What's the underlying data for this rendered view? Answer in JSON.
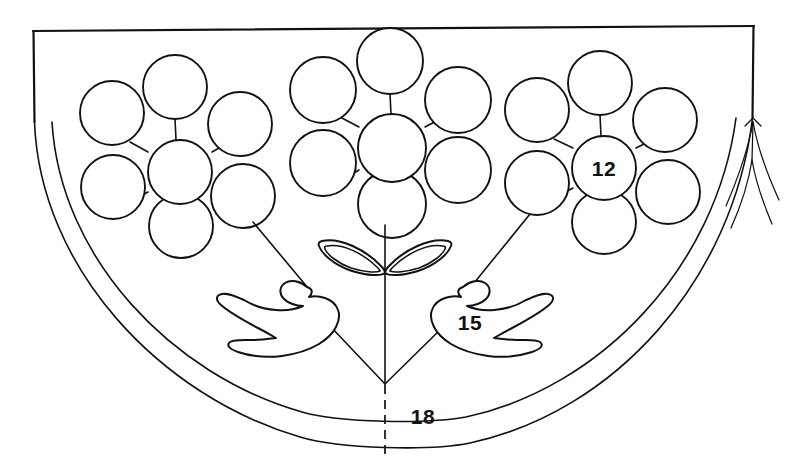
{
  "figure": {
    "background_color": "#ffffff",
    "ink_color": "#111111",
    "width": 804,
    "height": 468
  },
  "reference_labels": [
    {
      "id": "ref-12",
      "text": "12",
      "x": 604,
      "y": 176,
      "describes": "seven-circle rosette cluster"
    },
    {
      "id": "ref-15",
      "text": "15",
      "x": 470,
      "y": 330,
      "describes": "wing / leaf ornament"
    },
    {
      "id": "ref-18",
      "text": "18",
      "x": 423,
      "y": 424,
      "describes": "bowl rim band"
    }
  ],
  "outline": {
    "top_edge": {
      "x1": 33,
      "y1": 31,
      "x2": 754,
      "y2": 26
    },
    "left_edge": {
      "x1": 33,
      "y1": 31,
      "x2": 34,
      "y2": 122
    },
    "right_edge": {
      "x1": 754,
      "y1": 26,
      "x2": 753,
      "y2": 118
    },
    "outer_arc_label": "outer bowl wall",
    "inner_arc_label": "inner bowl wall"
  },
  "center_line": {
    "style": "dashed",
    "x": 385,
    "y_top": 385,
    "y_bottom": 455
  },
  "rosettes": [
    {
      "name": "left-rosette",
      "center_x": 180,
      "center_y": 172,
      "circle_radius": 32,
      "petal_count": 6,
      "center_label": ""
    },
    {
      "name": "middle-rosette",
      "center_x": 392,
      "center_y": 148,
      "circle_radius": 34,
      "petal_count": 6,
      "center_label": ""
    },
    {
      "name": "right-rosette",
      "center_x": 604,
      "center_y": 168,
      "circle_radius": 32,
      "petal_count": 6,
      "center_label": "12"
    }
  ],
  "ornaments": {
    "bow_petals": {
      "name": "central double-petal bow",
      "apex_x": 385,
      "apex_y": 272
    },
    "wings": [
      {
        "name": "left-wing",
        "side": "left"
      },
      {
        "name": "right-wing",
        "side": "right"
      }
    ]
  },
  "leader_lines": {
    "count": 4,
    "converge_x": 385,
    "converge_y": 384,
    "description": "leader lines from rosettes and wings converging at bowl center base"
  },
  "right_fork": {
    "name": "right-edge-branch-marks",
    "description": "branching tick marks at right edge"
  }
}
